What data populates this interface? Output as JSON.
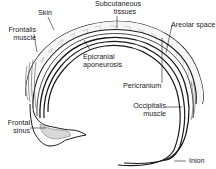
{
  "diagram": {
    "labels": {
      "skin": "Skin",
      "subcutaneous_line1": "Subcutaneous",
      "subcutaneous_line2": "tissues",
      "frontalis_line1": "Frontalis",
      "frontalis_line2": "muscle",
      "areolar": "Areolar space",
      "epicranial_line1": "Epicranial",
      "epicranial_line2": "aponeurosis",
      "pericranium": "Pericranium",
      "occipitalis_line1": "Occipitalis",
      "occipitalis_line2": "muscle",
      "frontal_sinus_line1": "Frontal",
      "frontal_sinus_line2": "sinus",
      "inion": "Inion"
    },
    "colors": {
      "line": "#1a1a1a",
      "tissue_fill": "#f4f4f4",
      "hatch": "#9a9a9a",
      "sinus_fill": "#d8d8d8"
    }
  }
}
